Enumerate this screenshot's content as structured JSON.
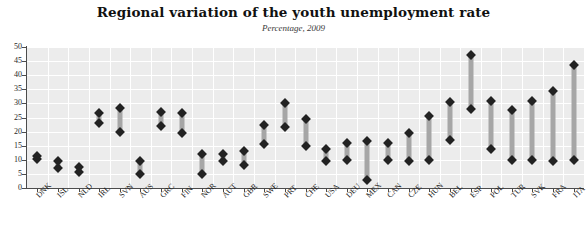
{
  "chart_data": {
    "type": "bar",
    "subtype": "range-bar-with-endpoint-markers",
    "title": "Regional variation of the youth unemployment rate",
    "subtitle": "Percentage, 2009",
    "xlabel": "",
    "ylabel": "",
    "ylim": [
      0,
      50
    ],
    "yticks": [
      0,
      5,
      10,
      15,
      20,
      25,
      30,
      35,
      40,
      45,
      50
    ],
    "grid": true,
    "legend": false,
    "categories": [
      "DNK",
      "ISL",
      "NLD",
      "IRL",
      "SVN",
      "AUS",
      "GRC",
      "FIN",
      "NOR",
      "AUT",
      "GBR",
      "SWE",
      "PRT",
      "CHE",
      "USA",
      "DEU",
      "MEX",
      "CAN",
      "CZE",
      "HUN",
      "BEL",
      "ESP",
      "POL",
      "TUR",
      "SVK",
      "FRA",
      "ITA"
    ],
    "series": [
      {
        "name": "Minimum regional rate",
        "values": [
          10.3,
          7.2,
          5.7,
          23.0,
          20.0,
          5.0,
          22.0,
          19.5,
          5.0,
          9.5,
          8.0,
          15.5,
          21.5,
          15.0,
          9.5,
          10.0,
          3.0,
          10.0,
          9.5,
          10.0,
          17.0,
          28.0,
          14.0,
          10.0,
          10.0,
          9.5,
          10.0
        ]
      },
      {
        "name": "Maximum regional rate",
        "values": [
          11.5,
          9.5,
          7.5,
          26.5,
          28.3,
          9.5,
          27.0,
          26.5,
          12.0,
          12.0,
          13.0,
          22.5,
          30.0,
          24.5,
          14.0,
          16.0,
          16.5,
          16.0,
          19.5,
          25.5,
          30.5,
          47.0,
          31.0,
          27.5,
          31.0,
          34.5,
          43.5
        ]
      }
    ]
  },
  "colors": {
    "plot_background": "#ececec",
    "gridline": "#ffffff",
    "bar_fill": "#a6a6a6",
    "marker_fill": "#222222",
    "axis_line": "#4c4c4c",
    "title_text": "#111111",
    "subtitle_text": "#3a3a3a"
  }
}
